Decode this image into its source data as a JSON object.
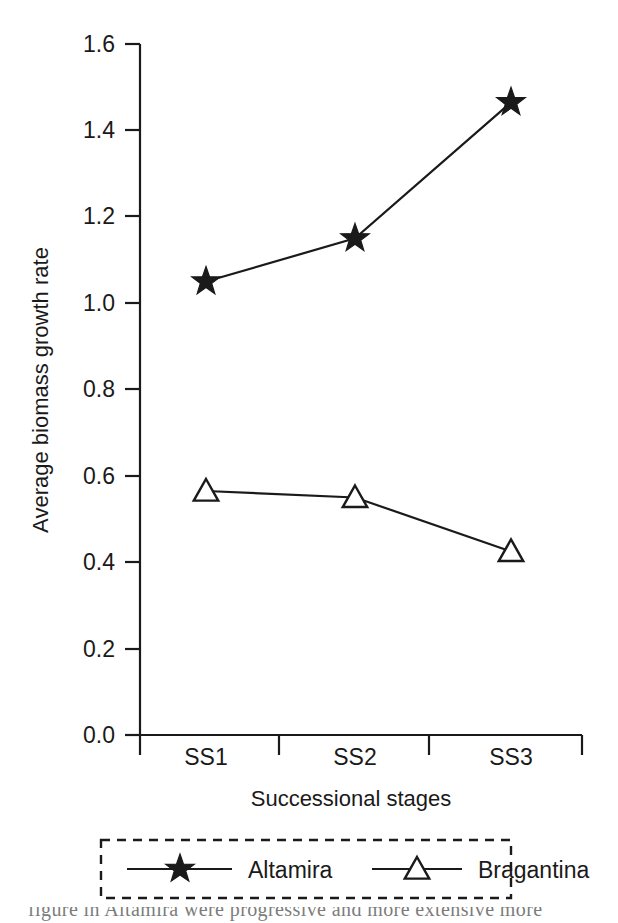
{
  "chart_data": {
    "type": "line",
    "title": "",
    "xlabel": "Successional stages",
    "ylabel": "Average biomass growth rate",
    "categories": [
      "SS1",
      "SS2",
      "SS3"
    ],
    "ylim": [
      0.0,
      1.6
    ],
    "yticks": [
      "0.0",
      "0.2",
      "0.4",
      "0.6",
      "0.8",
      "1.0",
      "1.2",
      "1.4",
      "1.6"
    ],
    "ytick_values": [
      0.0,
      0.2,
      0.4,
      0.6,
      0.8,
      1.0,
      1.2,
      1.4,
      1.6
    ],
    "grid": false,
    "legend_position": "below-axis",
    "series": [
      {
        "name": "Altamira",
        "marker": "filled-star",
        "values": [
          1.05,
          1.15,
          1.465
        ]
      },
      {
        "name": "Bragantina",
        "marker": "open-triangle",
        "values": [
          0.565,
          0.55,
          0.425
        ]
      }
    ]
  },
  "axes": {
    "y_title": "Average biomass growth rate",
    "x_title": "Successional stages",
    "y_tick_labels": [
      "1.6",
      "1.4",
      "1.2",
      "1.0",
      "0.8",
      "0.6",
      "0.4",
      "0.2",
      "0.0"
    ],
    "x_tick_labels": [
      "SS1",
      "SS2",
      "SS3"
    ]
  },
  "legend": {
    "entries": [
      {
        "label": "Altamira",
        "marker": "filled-star"
      },
      {
        "label": "Bragantina",
        "marker": "open-triangle"
      }
    ]
  },
  "caption": {
    "text": "figure in Altamira were progressive and more extensive more"
  }
}
